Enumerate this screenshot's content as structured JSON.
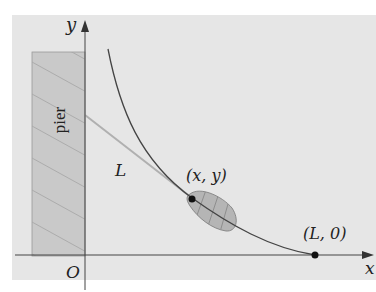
{
  "figure": {
    "background_color": "#e6e6e6",
    "pier_color": "#c8c8c8",
    "line_color": "#333333",
    "labels": {
      "y_axis": "y",
      "x_axis": "x",
      "origin": "O",
      "pier": "pier",
      "rope": "L",
      "boat_point": "(x, y)",
      "end_point": "(L, 0)"
    }
  }
}
